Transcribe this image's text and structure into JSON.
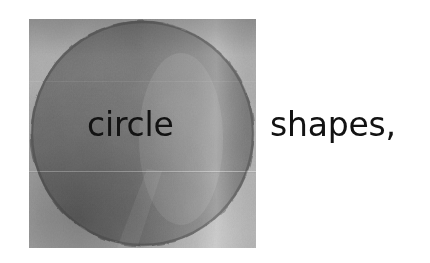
{
  "canvas": {
    "width": 430,
    "height": 263,
    "background_color": "#ffffff"
  },
  "figure": {
    "kind": "photographic-object",
    "object_name": "circle-shape-disk",
    "shape": "circle",
    "bounds": {
      "x": 29,
      "y": 19,
      "width": 227,
      "height": 229
    },
    "colors": {
      "base_gray": "#7d7d7d",
      "light_gray": "#9b9b9b",
      "mid_gray": "#868686",
      "dark_gray": "#555555",
      "edge_dark": "#4a4a4a",
      "highlight": "#a8a8a8",
      "background": "#ffffff"
    },
    "features": [
      "rough scanned edge",
      "vertical light highlight band on right side",
      "horizontal light seam line across lower third",
      "darker shading along bottom-left rim",
      "fine halftone / paper grain texture"
    ]
  },
  "text": {
    "label_on_circle": "circle",
    "label_beside_circle": "shapes,",
    "color": "#121212",
    "font_size_px": 33,
    "baseline_y": 141
  }
}
